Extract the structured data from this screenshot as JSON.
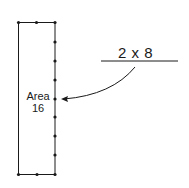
{
  "diagram": {
    "area_label": "Area",
    "area_value": "16",
    "expression": "2 x 8",
    "colors": {
      "stroke": "#1a1a1a",
      "background": "#ffffff"
    },
    "rectangle": {
      "width_units": 2,
      "height_units": 8
    }
  }
}
